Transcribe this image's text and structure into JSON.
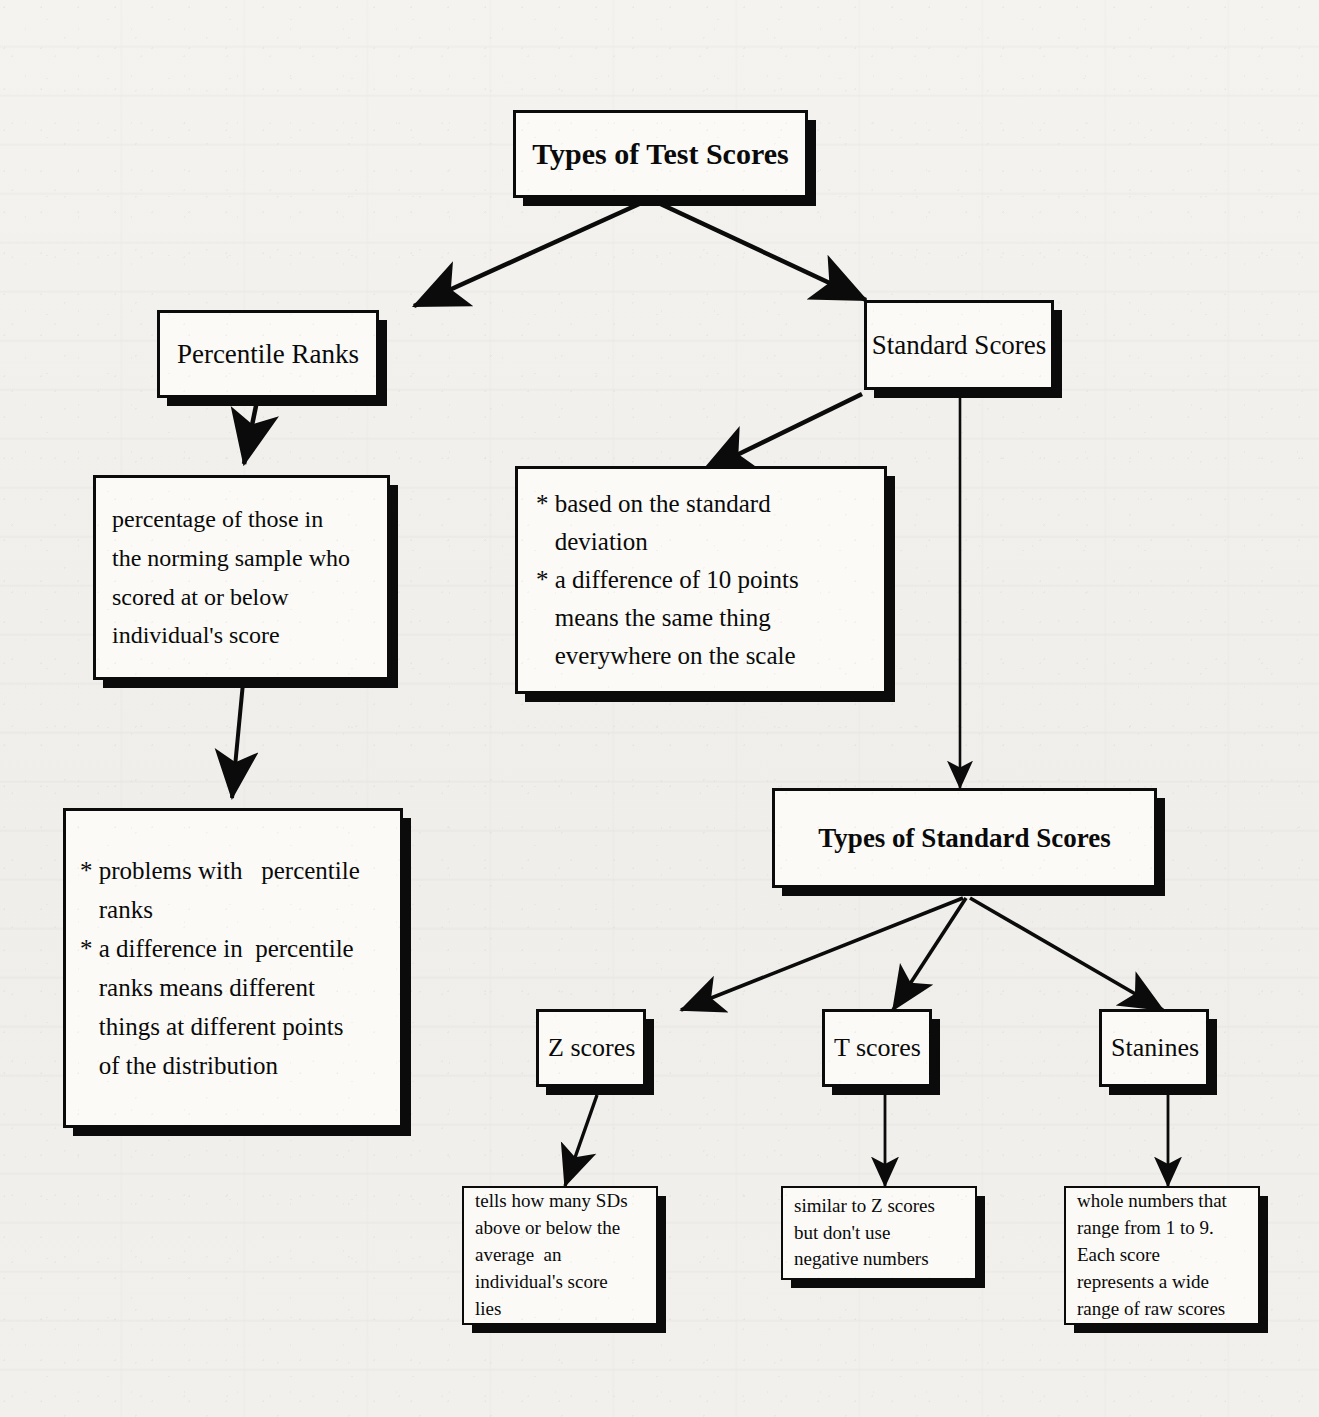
{
  "diagram": {
    "title": "Types of Test Scores",
    "nodes": {
      "root": {
        "label": "Types of Test Scores"
      },
      "percentile": {
        "label": "Percentile Ranks"
      },
      "standard": {
        "label": "Standard Scores"
      },
      "percentile_def": {
        "label": "percentage of those in\nthe norming sample who\nscored at or below\nindividual's score"
      },
      "standard_props": {
        "label": "* based on the standard\n   deviation\n* a difference of 10 points\n   means the same thing\n   everywhere on the scale"
      },
      "percentile_probs": {
        "label": "* problems with   percentile\n   ranks\n* a difference in  percentile\n   ranks means different\n   things at different points\n   of the distribution"
      },
      "types_standard": {
        "label": "Types of Standard Scores"
      },
      "z_scores": {
        "label": "Z scores"
      },
      "t_scores": {
        "label": "T scores"
      },
      "stanines": {
        "label": "Stanines"
      },
      "z_def": {
        "label": "tells how many SDs\nabove or below the\naverage  an\nindividual's score\nlies"
      },
      "t_def": {
        "label": "similar to Z scores\nbut don't use\nnegative numbers"
      },
      "stanine_def": {
        "label": "whole numbers that\nrange from 1 to 9.\nEach score\nrepresents a wide\nrange of raw scores"
      }
    },
    "edges": [
      {
        "from": "root",
        "to": "percentile"
      },
      {
        "from": "root",
        "to": "standard"
      },
      {
        "from": "percentile",
        "to": "percentile_def"
      },
      {
        "from": "percentile_def",
        "to": "percentile_probs"
      },
      {
        "from": "standard",
        "to": "standard_props"
      },
      {
        "from": "standard",
        "to": "types_standard"
      },
      {
        "from": "types_standard",
        "to": "z_scores"
      },
      {
        "from": "types_standard",
        "to": "t_scores"
      },
      {
        "from": "types_standard",
        "to": "stanines"
      },
      {
        "from": "z_scores",
        "to": "z_def"
      },
      {
        "from": "t_scores",
        "to": "t_def"
      },
      {
        "from": "stanines",
        "to": "stanine_def"
      }
    ],
    "colors": {
      "ink": "#0b0b0b",
      "box_fill": "#fbfaf7",
      "paper": "#f2f1ee"
    }
  }
}
